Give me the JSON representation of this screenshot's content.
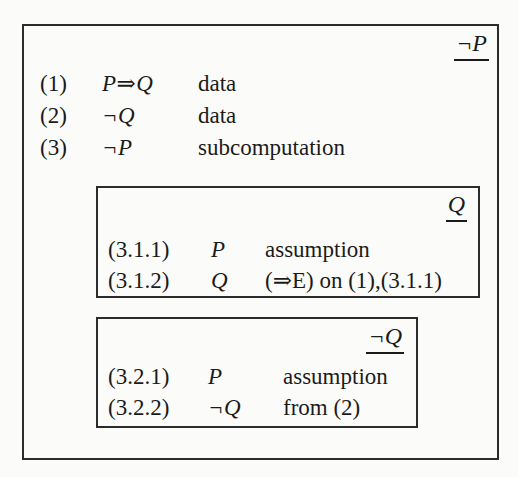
{
  "proof": {
    "outer": {
      "goal": "¬P",
      "lines": [
        {
          "num": "(1)",
          "formula": "P⇒Q",
          "just": "data"
        },
        {
          "num": "(2)",
          "formula": "¬Q",
          "just": "data"
        },
        {
          "num": "(3)",
          "formula": "¬P",
          "just": "subcomputation"
        }
      ]
    },
    "subbox_q": {
      "goal": "Q",
      "lines": [
        {
          "num": "(3.1.1)",
          "formula": "P",
          "just": "assumption"
        },
        {
          "num": "(3.1.2)",
          "formula": "Q",
          "just": "(⇒E) on (1),(3.1.1)"
        }
      ]
    },
    "subbox_not_q": {
      "goal": "¬Q",
      "lines": [
        {
          "num": "(3.2.1)",
          "formula": "P",
          "just": "assumption"
        },
        {
          "num": "(3.2.2)",
          "formula": "¬Q",
          "just": "from (2)"
        }
      ]
    }
  }
}
